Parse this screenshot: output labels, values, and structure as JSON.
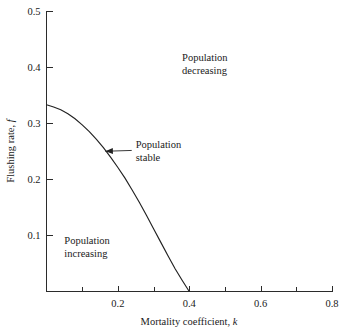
{
  "chart_data": {
    "type": "line",
    "title": "",
    "xlabel": "Mortality coefficient, k",
    "xlabel_text": "Mortality coefficient,",
    "xlabel_symbol": "k",
    "ylabel": "Flushing rate, f",
    "ylabel_text": "Flushing rate,",
    "ylabel_symbol": "f",
    "xlim": [
      0,
      0.8
    ],
    "ylim": [
      0,
      0.5
    ],
    "grid": false,
    "legend": "none",
    "x_major_ticks": [
      0.2,
      0.4,
      0.6,
      0.8
    ],
    "x_major_tick_labels": [
      "0.2",
      "0.4",
      "0.6",
      "0.8"
    ],
    "x_minor_ticks": [
      0.1,
      0.3,
      0.5,
      0.7
    ],
    "y_major_ticks": [
      0.1,
      0.2,
      0.3,
      0.4,
      0.5
    ],
    "y_major_tick_labels": [
      "0.1",
      "0.2",
      "0.3",
      "0.4",
      "0.5"
    ],
    "series": [
      {
        "name": "Population stable boundary",
        "x": [
          0.0,
          0.02,
          0.04,
          0.06,
          0.08,
          0.1,
          0.12,
          0.14,
          0.16,
          0.18,
          0.2,
          0.22,
          0.24,
          0.26,
          0.28,
          0.3,
          0.32,
          0.34,
          0.36,
          0.38,
          0.4
        ],
        "y": [
          0.333,
          0.329,
          0.324,
          0.317,
          0.308,
          0.297,
          0.285,
          0.271,
          0.256,
          0.239,
          0.221,
          0.202,
          0.181,
          0.159,
          0.136,
          0.112,
          0.088,
          0.064,
          0.041,
          0.02,
          0.0
        ]
      }
    ],
    "annotations": [
      {
        "id": "population-decreasing",
        "line1": "Population",
        "line2": "decreasing",
        "x": 0.38,
        "y": 0.41
      },
      {
        "id": "population-stable",
        "line1": "Population",
        "line2": "stable",
        "x": 0.25,
        "y": 0.255,
        "points_to_x": 0.165,
        "points_to_y": 0.25
      },
      {
        "id": "population-increasing",
        "line1": "Population",
        "line2": "increasing",
        "x": 0.05,
        "y": 0.085
      }
    ],
    "colors": {
      "curve": "#222222",
      "axis": "#2b2b2b",
      "text": "#1a1a1a",
      "background": "#ffffff"
    }
  }
}
